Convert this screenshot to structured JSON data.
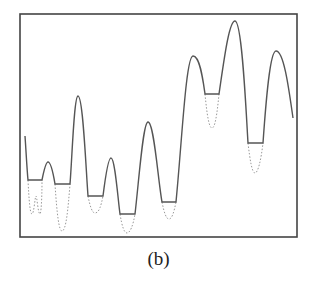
{
  "figure": {
    "caption": "(b)",
    "colors": {
      "frame": "#444444",
      "curve": "#555555",
      "dotted": "#999999"
    },
    "frame": {
      "x": 20,
      "y": 14,
      "width": 277,
      "height": 223
    },
    "solid_path": "M25,136 C26,150 27,170 28,180 L42,180 C44,170 46,162 48,162 C51,162 53,172 55,184 L70,184 C72,160 74,96 78,96 C83,96 86,170 88,196 L103,196 C105,180 108,158 111,158 C115,158 118,200 120,214 L135,214 C139,180 143,122 148,122 C154,122 158,180 162,202 L176,202 C182,140 186,56 193,56 C200,56 203,80 205,94 L219,94 C224,60 229,21 235,21 C242,21 246,110 248,143 L263,143 C266,100 270,51 276,51 C284,51 289,90 293,118",
    "dotted_paths": [
      "M28,180 C29,200 30,214 32,214 C34,214 35,196 36,196 C37,196 38,214 40,214 C41,214 42,200 42,180",
      "M55,184 C57,215 59,231 62,231 C66,231 68,210 70,184",
      "M88,196 C90,206 92,213 95,213 C99,213 101,206 103,196",
      "M120,214 C122,226 124,233 127,233 C130,233 133,226 135,214",
      "M162,202 C164,212 166,219 169,219 C172,219 174,212 176,202",
      "M205,94 C207,115 209,128 212,128 C215,128 217,115 219,94",
      "M248,143 C250,160 252,173 255,173 C258,173 261,160 263,143"
    ]
  }
}
